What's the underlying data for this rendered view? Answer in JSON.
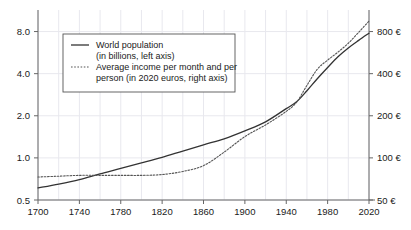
{
  "chart_data": {
    "type": "line",
    "title": "",
    "subtitle": "",
    "xlabel": "",
    "ylabel": "",
    "grid": true,
    "legend_position": "top-left",
    "x_axis": {
      "ticks": [
        1700,
        1740,
        1780,
        1820,
        1860,
        1900,
        1940,
        1980,
        2020
      ],
      "tick_labels": [
        "1700",
        "1740",
        "1780",
        "1820",
        "1860",
        "1900",
        "1940",
        "1980",
        "2020"
      ],
      "minor_step": 20,
      "xlim": [
        1700,
        2020
      ]
    },
    "y_axis_left": {
      "scale": "log",
      "ticks": [
        0.5,
        1.0,
        2.0,
        4.0,
        8.0
      ],
      "tick_labels": [
        "0.5",
        "1.0",
        "2.0",
        "4.0",
        "8.0"
      ],
      "ylim": [
        0.5,
        10.0
      ],
      "unit": "billions"
    },
    "y_axis_right": {
      "scale": "log",
      "ticks": [
        50,
        100,
        200,
        400,
        800
      ],
      "tick_labels": [
        "50 €",
        "100 €",
        "200 €",
        "400 €",
        "800 €"
      ],
      "ylim": [
        50,
        1000
      ],
      "unit": "2020 euros"
    },
    "series": [
      {
        "name": "World population",
        "axis": "left",
        "style": "solid",
        "color": "#333333",
        "x": [
          1700,
          1720,
          1740,
          1760,
          1780,
          1800,
          1820,
          1840,
          1860,
          1880,
          1900,
          1920,
          1940,
          1950,
          1960,
          1970,
          1980,
          1990,
          2000,
          2010,
          2020
        ],
        "values": [
          0.61,
          0.65,
          0.7,
          0.77,
          0.84,
          0.92,
          1.01,
          1.12,
          1.24,
          1.37,
          1.56,
          1.81,
          2.25,
          2.52,
          3.02,
          3.68,
          4.43,
          5.29,
          6.11,
          6.92,
          7.79
        ]
      },
      {
        "name": "Average income per month and per person",
        "axis": "right",
        "style": "dotted",
        "color": "#555555",
        "x": [
          1700,
          1720,
          1740,
          1760,
          1780,
          1800,
          1820,
          1840,
          1860,
          1880,
          1900,
          1920,
          1940,
          1950,
          1960,
          1970,
          1980,
          1990,
          2000,
          2010,
          2020
        ],
        "values": [
          73,
          74,
          75,
          75,
          75,
          75,
          76,
          80,
          88,
          110,
          142,
          172,
          215,
          250,
          330,
          430,
          500,
          570,
          660,
          790,
          950
        ]
      }
    ]
  },
  "legend": {
    "entries": [
      {
        "marker": "solid-line-swatch",
        "line1": "World population",
        "line2": "(in billions, left axis)"
      },
      {
        "marker": "dotted-line-swatch",
        "line1": "Average income per month and per",
        "line2": "person (in 2020 euros, right axis)"
      }
    ]
  },
  "colors": {
    "population_line": "#333333",
    "income_line": "#555555",
    "axis": "#666666",
    "grid": "#e8e8ee",
    "text": "#1a1a1a",
    "legend_border": "#555555",
    "background": "#ffffff"
  }
}
